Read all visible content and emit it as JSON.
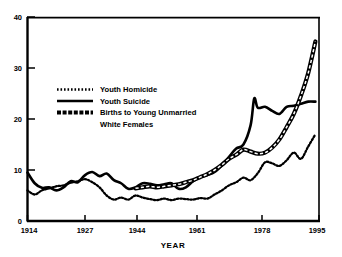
{
  "chart_data": {
    "type": "line",
    "title": "",
    "xlabel": "YEAR",
    "ylabel": "",
    "xlim": [
      1914,
      1995
    ],
    "ylim": [
      0,
      40
    ],
    "xticks": [
      1914,
      1927,
      1944,
      1961,
      1978,
      1995
    ],
    "xtick_labels": [
      "1914",
      "1927",
      "1944",
      "1961",
      "1978",
      "1995"
    ],
    "yticks": [
      0,
      10,
      20,
      30,
      40
    ],
    "ytick_labels": [
      "0",
      "10",
      "20",
      "30",
      "40"
    ],
    "grid": false,
    "legend_position": "upper-left-inside",
    "series": [
      {
        "name": "Youth Homicide",
        "style": "dotted",
        "x": [
          1914,
          1916,
          1918,
          1920,
          1922,
          1924,
          1926,
          1928,
          1930,
          1932,
          1934,
          1936,
          1938,
          1940,
          1942,
          1944,
          1946,
          1948,
          1950,
          1952,
          1954,
          1956,
          1958,
          1960,
          1962,
          1964,
          1966,
          1968,
          1970,
          1972,
          1974,
          1976,
          1978,
          1980,
          1982,
          1984,
          1986,
          1988,
          1990,
          1992,
          1994
        ],
        "values": [
          6.0,
          5.2,
          6.0,
          6.4,
          6.8,
          7.0,
          7.5,
          7.8,
          8.2,
          7.6,
          6.6,
          5.0,
          4.2,
          4.6,
          4.2,
          5.0,
          4.6,
          4.3,
          4.1,
          4.4,
          4.1,
          4.4,
          4.3,
          4.2,
          4.5,
          4.4,
          5.2,
          6.0,
          7.0,
          7.6,
          8.5,
          8.0,
          9.4,
          11.5,
          11.3,
          10.8,
          11.9,
          13.4,
          12.2,
          14.6,
          17.0
        ]
      },
      {
        "name": "Youth Suicide",
        "style": "solid",
        "x": [
          1914,
          1916,
          1918,
          1920,
          1922,
          1924,
          1926,
          1928,
          1930,
          1932,
          1934,
          1936,
          1938,
          1940,
          1942,
          1944,
          1946,
          1948,
          1950,
          1952,
          1954,
          1956,
          1958,
          1960,
          1962,
          1964,
          1966,
          1968,
          1970,
          1972,
          1974,
          1976,
          1977,
          1978,
          1980,
          1982,
          1984,
          1986,
          1988,
          1990,
          1992,
          1994
        ],
        "values": [
          9.5,
          7.4,
          6.5,
          6.6,
          6.0,
          6.6,
          7.8,
          7.6,
          9.0,
          9.6,
          8.8,
          9.3,
          8.0,
          7.4,
          6.3,
          6.6,
          7.4,
          7.3,
          7.0,
          7.2,
          7.4,
          6.3,
          6.6,
          7.8,
          8.6,
          9.0,
          9.6,
          10.9,
          12.6,
          14.2,
          15.0,
          18.8,
          24.0,
          22.2,
          22.4,
          21.6,
          21.0,
          22.4,
          22.6,
          23.0,
          23.4,
          23.4
        ]
      },
      {
        "name": "Births to Young Unmarried White Females",
        "style": "dashed-band",
        "x": [
          1944,
          1946,
          1948,
          1950,
          1952,
          1954,
          1956,
          1958,
          1960,
          1962,
          1964,
          1966,
          1968,
          1970,
          1972,
          1974,
          1976,
          1978,
          1980,
          1982,
          1984,
          1986,
          1988,
          1990,
          1992,
          1994
        ],
        "values": [
          6.4,
          6.6,
          6.8,
          6.6,
          6.8,
          7.0,
          7.2,
          7.6,
          8.0,
          8.6,
          9.2,
          10.0,
          11.0,
          12.2,
          13.0,
          14.0,
          13.6,
          13.2,
          13.4,
          14.4,
          16.0,
          18.4,
          21.0,
          24.6,
          29.0,
          35.2
        ]
      }
    ],
    "legend_entries": [
      {
        "label": "Youth Homicide",
        "style": "dotted"
      },
      {
        "label": "Youth Suicide",
        "style": "solid"
      },
      {
        "label": "Births to Young Unmarried",
        "style": "dashed-band"
      },
      {
        "label": "White Females",
        "style": "none"
      }
    ],
    "colors": {
      "line": "#000000",
      "background": "#ffffff",
      "axis": "#000000"
    }
  }
}
